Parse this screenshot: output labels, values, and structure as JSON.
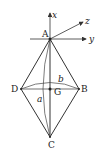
{
  "diagram": {
    "points": {
      "A": {
        "label": "A",
        "x": 50,
        "y": 39
      },
      "B": {
        "label": "B",
        "x": 79,
        "y": 89
      },
      "C": {
        "label": "C",
        "x": 50,
        "y": 137
      },
      "D": {
        "label": "D",
        "x": 21,
        "y": 89
      },
      "G": {
        "label": "G",
        "x": 50,
        "y": 89
      }
    },
    "axes": {
      "x": {
        "label": "x"
      },
      "y": {
        "label": "y"
      },
      "z": {
        "label": "z"
      }
    },
    "arcs": {
      "a": {
        "label": "a"
      },
      "b": {
        "label": "b"
      }
    },
    "colors": {
      "stroke": "#333333",
      "background": "#ffffff"
    }
  }
}
